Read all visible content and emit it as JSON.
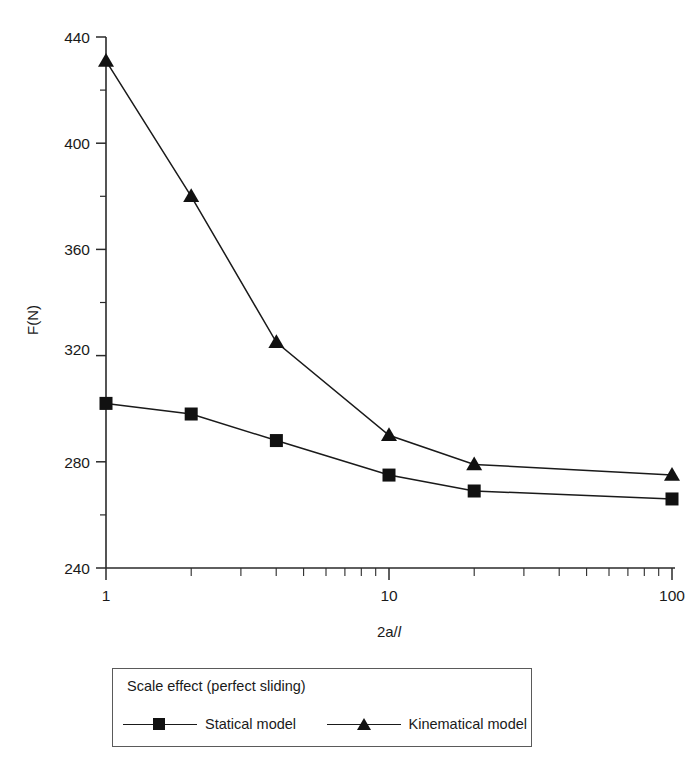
{
  "chart_data": {
    "type": "line",
    "title": "",
    "xlabel": "2a/l",
    "xlabel_parts": {
      "plain": "2a/",
      "italic": "l"
    },
    "ylabel": "F(N)",
    "xscale": "log",
    "xlim": [
      1,
      100
    ],
    "ylim": [
      240,
      440
    ],
    "ytick_step": 40,
    "yminor_step": 20,
    "grid": false,
    "legend_position": "below-plot",
    "legend_title": "Scale effect (perfect sliding)",
    "x": [
      1,
      2,
      4,
      10,
      20,
      100
    ],
    "xticks": [
      "1",
      "10",
      "100"
    ],
    "yticks": [
      "240",
      "280",
      "320",
      "360",
      "400",
      "440"
    ],
    "series": [
      {
        "name": "Statical model",
        "marker": "square",
        "color": "#111111",
        "values": [
          302,
          298,
          288,
          275,
          269,
          266
        ]
      },
      {
        "name": "Kinematical model",
        "marker": "triangle",
        "color": "#111111",
        "values": [
          431,
          380,
          325,
          290,
          279,
          275
        ]
      }
    ]
  },
  "axes": {
    "y_label": "F(N)",
    "x_label_plain": "2a/",
    "x_label_italic": "l",
    "y_tick_440": "440",
    "y_tick_400": "400",
    "y_tick_360": "360",
    "y_tick_320": "320",
    "y_tick_280": "280",
    "y_tick_240": "240",
    "x_tick_1": "1",
    "x_tick_10": "10",
    "x_tick_100": "100"
  },
  "legend": {
    "title": "Scale effect (perfect sliding)",
    "entries": [
      {
        "label": "Statical model",
        "marker": "square-marker"
      },
      {
        "label": "Kinematical model",
        "marker": "triangle-marker"
      }
    ]
  }
}
